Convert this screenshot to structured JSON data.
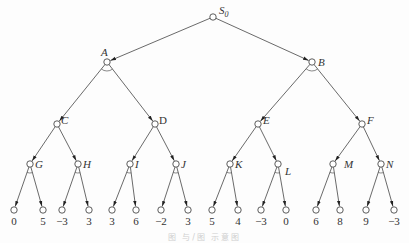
{
  "diagram": {
    "type": "and-or-game-tree",
    "root": "S0",
    "nodes": [
      {
        "id": "S0",
        "label": "S",
        "sub": "0",
        "x": 213,
        "y": 17
      },
      {
        "id": "A",
        "label": "A",
        "x": 107,
        "y": 62
      },
      {
        "id": "B",
        "label": "B",
        "x": 312,
        "y": 62
      },
      {
        "id": "C",
        "label": "C",
        "x": 57,
        "y": 124
      },
      {
        "id": "D",
        "label": "D",
        "x": 155,
        "y": 124
      },
      {
        "id": "E",
        "label": "E",
        "x": 258,
        "y": 124
      },
      {
        "id": "F",
        "label": "F",
        "x": 362,
        "y": 124
      },
      {
        "id": "G",
        "label": "G",
        "x": 30,
        "y": 164
      },
      {
        "id": "H",
        "label": "H",
        "x": 78,
        "y": 164
      },
      {
        "id": "I",
        "label": "I",
        "x": 130,
        "y": 164
      },
      {
        "id": "J",
        "label": "J",
        "x": 176,
        "y": 164
      },
      {
        "id": "K",
        "label": "K",
        "x": 230,
        "y": 164
      },
      {
        "id": "L",
        "label": "L",
        "x": 278,
        "y": 164
      },
      {
        "id": "M",
        "label": "M",
        "x": 333,
        "y": 164
      },
      {
        "id": "N",
        "label": "N",
        "x": 381,
        "y": 164
      }
    ],
    "edges": [
      [
        "S0",
        "A"
      ],
      [
        "S0",
        "B"
      ],
      [
        "A",
        "C"
      ],
      [
        "A",
        "D"
      ],
      [
        "B",
        "E"
      ],
      [
        "B",
        "F"
      ],
      [
        "C",
        "G"
      ],
      [
        "C",
        "H"
      ],
      [
        "D",
        "I"
      ],
      [
        "D",
        "J"
      ],
      [
        "E",
        "K"
      ],
      [
        "E",
        "L"
      ],
      [
        "F",
        "M"
      ],
      [
        "F",
        "N"
      ]
    ],
    "and_nodes": [
      "A",
      "B",
      "G",
      "H",
      "I",
      "J",
      "K",
      "L",
      "M",
      "N"
    ],
    "leaves": [
      {
        "parent": "G",
        "value": "0",
        "x": 14
      },
      {
        "parent": "G",
        "value": "5",
        "x": 43
      },
      {
        "parent": "H",
        "value": "−3",
        "x": 62
      },
      {
        "parent": "H",
        "value": "3",
        "x": 89
      },
      {
        "parent": "I",
        "value": "3",
        "x": 112
      },
      {
        "parent": "I",
        "value": "6",
        "x": 136
      },
      {
        "parent": "J",
        "value": "−2",
        "x": 161
      },
      {
        "parent": "J",
        "value": "3",
        "x": 188
      },
      {
        "parent": "K",
        "value": "5",
        "x": 212
      },
      {
        "parent": "K",
        "value": "4",
        "x": 238
      },
      {
        "parent": "L",
        "value": "−3",
        "x": 261
      },
      {
        "parent": "L",
        "value": "0",
        "x": 286
      },
      {
        "parent": "M",
        "value": "6",
        "x": 316
      },
      {
        "parent": "M",
        "value": "8",
        "x": 340
      },
      {
        "parent": "N",
        "value": "9",
        "x": 366
      },
      {
        "parent": "N",
        "value": "−3",
        "x": 394
      }
    ],
    "leaf_y": 210,
    "caption": "图  与/图  示意图"
  }
}
